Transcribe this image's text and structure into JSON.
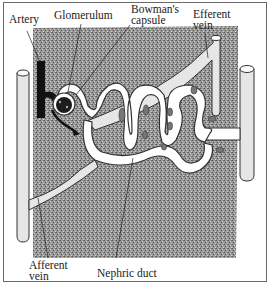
{
  "diagram": {
    "labels": {
      "artery": "Artery",
      "glomerulum": "Glomerulum",
      "bowmans_capsule_line1": "Bowman's",
      "bowmans_capsule_line2": "capsule",
      "efferent_vein_line1": "Efferent",
      "efferent_vein_line2": "vein",
      "afferent_vein_line1": "Afferent",
      "afferent_vein_line2": "vein",
      "nephric_duct": "Nephric duct"
    },
    "colors": {
      "background_tissue": "#8c8c8c",
      "tubule_fill": "#ffffff",
      "vessel_fill": "#e6e6e6",
      "artery": "#111111",
      "outline": "#333333",
      "frame_border": "#6a6a6a"
    }
  }
}
